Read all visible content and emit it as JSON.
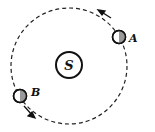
{
  "diagram": {
    "type": "orbit",
    "center_label": "S",
    "bodies": [
      {
        "label": "A"
      },
      {
        "label": "B"
      }
    ],
    "direction": "counterclockwise"
  }
}
